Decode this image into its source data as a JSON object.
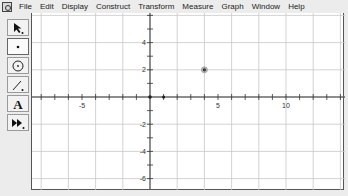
{
  "menubar": {
    "items": [
      "File",
      "Edit",
      "Display",
      "Construct",
      "Transform",
      "Measure",
      "Graph",
      "Window",
      "Help"
    ]
  },
  "toolbox": {
    "tools": [
      {
        "name": "arrow-tool",
        "glyph": "➘"
      },
      {
        "name": "point-tool",
        "glyph": "•"
      },
      {
        "name": "compass-tool",
        "glyph": "⊙"
      },
      {
        "name": "straightedge-tool",
        "glyph": "⟋"
      },
      {
        "name": "text-tool",
        "glyph": "A"
      },
      {
        "name": "custom-tool",
        "glyph": "⏩"
      }
    ],
    "selected": "point-tool"
  },
  "graph": {
    "x_labels": [
      {
        "value": -5,
        "text": "-5"
      },
      {
        "value": 5,
        "text": "5"
      },
      {
        "value": 10,
        "text": "10"
      }
    ],
    "y_labels": [
      {
        "value": 4,
        "text": "4"
      },
      {
        "value": 2,
        "text": "2"
      },
      {
        "value": -2,
        "text": "-2"
      },
      {
        "value": -4,
        "text": "-4"
      },
      {
        "value": -6,
        "text": "-6"
      }
    ],
    "grid_spacing": 2,
    "points": [
      {
        "x": 4,
        "y": 2,
        "label": ""
      }
    ],
    "unit_point": {
      "x": 1,
      "y": 0
    },
    "origin": {
      "x": 0,
      "y": 0
    }
  }
}
